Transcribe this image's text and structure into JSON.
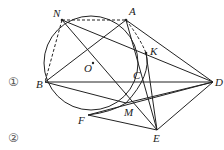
{
  "figure": {
    "type": "geometry-diagram",
    "circle": {
      "center_label": "O",
      "cx": 91,
      "cy": 63,
      "r": 47
    },
    "points": {
      "N": {
        "label": "N",
        "x": 62,
        "y": 20
      },
      "A": {
        "label": "A",
        "x": 126,
        "y": 20
      },
      "K": {
        "label": "K",
        "x": 146,
        "y": 53
      },
      "O": {
        "label": "O",
        "x": 93,
        "y": 63
      },
      "C": {
        "label": "C",
        "x": 144,
        "y": 80
      },
      "B": {
        "label": "B",
        "x": 45,
        "y": 82
      },
      "D": {
        "label": "D",
        "x": 213,
        "y": 82
      },
      "M": {
        "label": "M",
        "x": 126,
        "y": 103
      },
      "F": {
        "label": "F",
        "x": 88,
        "y": 115
      },
      "E": {
        "label": "E",
        "x": 157,
        "y": 130
      }
    },
    "side_labels": {
      "label1": "①",
      "label2": "②"
    }
  }
}
